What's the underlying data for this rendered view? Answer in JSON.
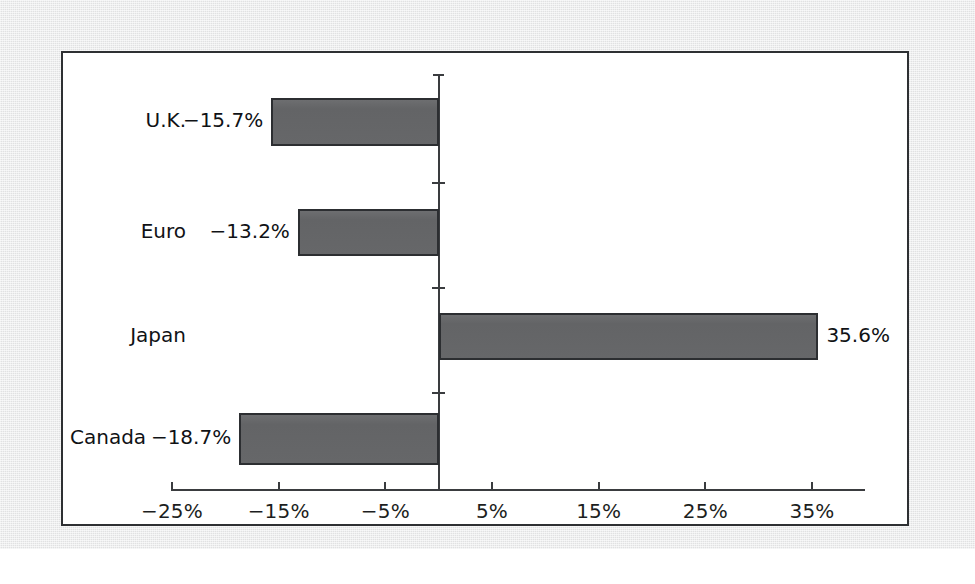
{
  "chart_data": {
    "type": "bar",
    "orientation": "horizontal",
    "title": "",
    "subtitle": "",
    "xlabel": "",
    "ylabel": "",
    "categories": [
      "U.K.",
      "Euro",
      "Japan",
      "Canada"
    ],
    "values": [
      -15.7,
      -13.2,
      35.6,
      -18.7
    ],
    "value_labels": [
      "−15.7%",
      "−13.2%",
      "35.6%",
      "−18.7%"
    ],
    "xlim": [
      -25,
      35
    ],
    "xticks": [
      -25,
      -15,
      -5,
      5,
      15,
      25,
      35
    ],
    "xtick_labels": [
      "−25%",
      "−15%",
      "−5%",
      "5%",
      "15%",
      "25%",
      "35%"
    ],
    "grid": false,
    "legend": false,
    "bar_color": "#67686a",
    "bar_edge_color": "#2c2e31",
    "axis_color": "#3a3c3f",
    "panel_background": "#ffffff",
    "page_background": "#e9eaeb",
    "series": [
      {
        "name": "Change",
        "values": [
          -15.7,
          -13.2,
          35.6,
          -18.7
        ]
      }
    ]
  },
  "panel": {
    "border_color": "#2e3033"
  }
}
